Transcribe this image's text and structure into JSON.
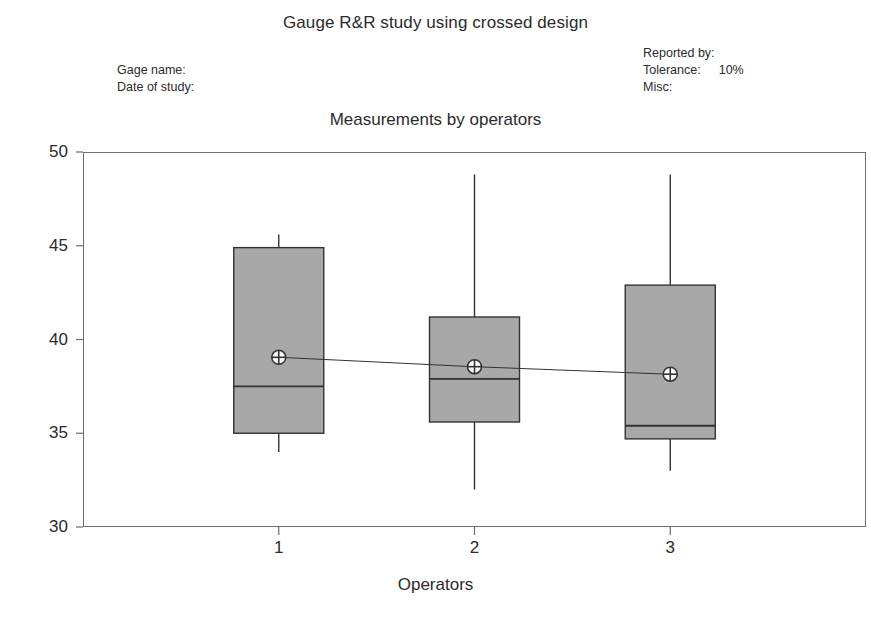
{
  "report": {
    "title": "Gauge R&R study using crossed design",
    "subtitle": "Measurements by operators",
    "header_left": [
      {
        "label": "Gage name:",
        "value": ""
      },
      {
        "label": "Date of study:",
        "value": ""
      }
    ],
    "header_right": [
      {
        "label": "Reported by:",
        "value": ""
      },
      {
        "label": "Tolerance:",
        "value": "10%"
      },
      {
        "label": "Misc:",
        "value": ""
      }
    ]
  },
  "colors": {
    "box_fill": "#a8a8a8",
    "box_stroke": "#333333",
    "axis": "#6e6e6e",
    "text": "#2b2b2b",
    "mean_line": "#333333"
  },
  "chart_data": {
    "type": "box",
    "title": "Measurements by operators",
    "xlabel": "Operators",
    "ylabel": "",
    "categories": [
      "1",
      "2",
      "3"
    ],
    "xticks": [
      "1",
      "2",
      "3"
    ],
    "yticks": [
      30,
      35,
      40,
      45,
      50
    ],
    "ylim": [
      30,
      50
    ],
    "grid": false,
    "legend": null,
    "series": [
      {
        "name": "Operator 1",
        "category": "1",
        "whisker_low": 34.0,
        "q1": 35.0,
        "median": 37.5,
        "q3": 44.9,
        "whisker_high": 45.6,
        "mean": 39.05
      },
      {
        "name": "Operator 2",
        "category": "2",
        "whisker_low": 32.0,
        "q1": 35.6,
        "median": 37.9,
        "q3": 41.2,
        "whisker_high": 48.8,
        "mean": 38.55
      },
      {
        "name": "Operator 3",
        "category": "3",
        "whisker_low": 33.0,
        "q1": 34.7,
        "median": 35.4,
        "q3": 42.9,
        "whisker_high": 48.8,
        "mean": 38.15
      }
    ],
    "mean_connector": true,
    "mean_marker": "crossed-circle"
  }
}
